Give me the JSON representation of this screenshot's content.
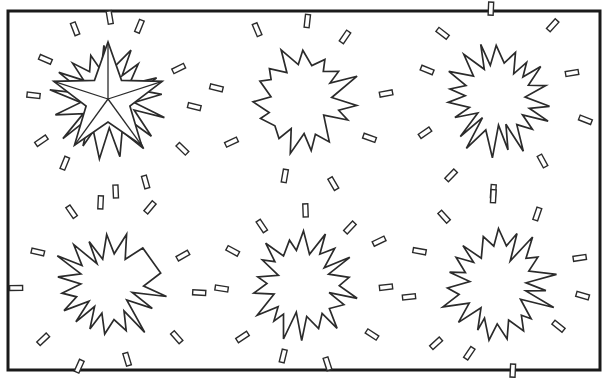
{
  "page": {
    "title": "Starburst / explosion shape worksheet",
    "background_color": "#ffffff",
    "ink_color": "#2b2b2b",
    "border_color": "#1a1a1a",
    "width": 610,
    "height": 381
  },
  "artifact": {
    "name": "cropped-logo-arc",
    "description": "faint grey partial circle clipped by the top edge",
    "color": "#9a9a9a",
    "x": 496,
    "y": -11,
    "width": 30,
    "height": 22
  },
  "frame": {
    "x": 8,
    "y": 11,
    "width": 592,
    "height": 359,
    "stroke_width": 3
  },
  "grid": {
    "rows": 2,
    "columns": 3,
    "cell_count": 6
  },
  "shapes": [
    {
      "index": 1,
      "name": "starburst-with-five-point-star",
      "label": "Burst 1",
      "center_x": 108,
      "center_y": 99,
      "outer_radius": 58,
      "inner_radius": 30,
      "spikes": 17,
      "seed": 11,
      "has_star_overlay": true,
      "star_points": 5,
      "star_outer_radius": 57,
      "star_inner_radius": 23,
      "star_rotation": -90,
      "star_has_facets": true,
      "debris_count": 12,
      "debris_radius": 86,
      "debris_seed": 3,
      "flat_edge": false
    },
    {
      "index": 2,
      "name": "starburst-plain-wide-spikes",
      "label": "Burst 2",
      "center_x": 303,
      "center_y": 99,
      "outer_radius": 56,
      "inner_radius": 33,
      "spikes": 15,
      "seed": 24,
      "has_star_overlay": false,
      "debris_count": 9,
      "debris_radius": 84,
      "debris_seed": 7,
      "flat_edge": false
    },
    {
      "index": 3,
      "name": "starburst-jagged-dense",
      "label": "Burst 3",
      "center_x": 498,
      "center_y": 99,
      "outer_radius": 57,
      "inner_radius": 31,
      "spikes": 19,
      "seed": 38,
      "has_star_overlay": false,
      "debris_count": 10,
      "debris_radius": 86,
      "debris_seed": 13,
      "flat_edge": false
    },
    {
      "index": 4,
      "name": "starburst-with-flat-upper-right-edge",
      "label": "Burst 4",
      "center_x": 108,
      "center_y": 285,
      "outer_radius": 58,
      "inner_radius": 30,
      "spikes": 18,
      "seed": 52,
      "has_star_overlay": false,
      "debris_count": 11,
      "debris_radius": 86,
      "debris_seed": 19,
      "flat_edge": true,
      "flat_edge_from": 300,
      "flat_edge_to": 355
    },
    {
      "index": 5,
      "name": "starburst-symmetric-medium",
      "label": "Burst 5",
      "center_x": 303,
      "center_y": 285,
      "outer_radius": 55,
      "inner_radius": 32,
      "spikes": 18,
      "seed": 66,
      "has_star_overlay": false,
      "debris_count": 11,
      "debris_radius": 83,
      "debris_seed": 27,
      "flat_edge": false
    },
    {
      "index": 6,
      "name": "starburst-rounded-dense",
      "label": "Burst 6",
      "center_x": 498,
      "center_y": 285,
      "outer_radius": 57,
      "inner_radius": 34,
      "spikes": 19,
      "seed": 81,
      "has_star_overlay": false,
      "debris_count": 11,
      "debris_radius": 85,
      "debris_seed": 33,
      "flat_edge": false
    }
  ],
  "debris": {
    "name": "debris-chip",
    "description": "small outlined rectangular chips radiating outward from each burst",
    "chip_length": 13,
    "chip_width": 5,
    "stroke_width": 1.4
  }
}
